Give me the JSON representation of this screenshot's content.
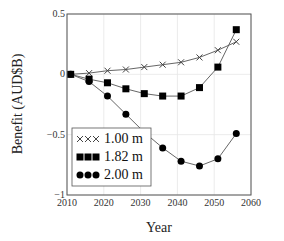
{
  "chart_data": {
    "type": "line",
    "title": "",
    "xlabel": "Year",
    "ylabel": "Benefit (AUD$B)",
    "xlim": [
      2010,
      2060
    ],
    "ylim": [
      -1,
      0.5
    ],
    "xticks": [
      2010,
      2020,
      2030,
      2040,
      2050,
      2060
    ],
    "xtick_labels": [
      "2010",
      "2020",
      "2030",
      "2040",
      "2050",
      "2060"
    ],
    "yticks": [
      -1,
      -0.5,
      0,
      0.5
    ],
    "ytick_labels": [
      "−1",
      "−0.5",
      "0",
      "0.5"
    ],
    "grid": true,
    "legend_position": "lower left",
    "x": [
      2011,
      2016,
      2021,
      2026,
      2031,
      2036,
      2041,
      2046,
      2051,
      2056
    ],
    "series": [
      {
        "name": "1.00 m",
        "marker": "x",
        "color": "#444444",
        "values": [
          0.0,
          0.01,
          0.03,
          0.04,
          0.06,
          0.08,
          0.1,
          0.14,
          0.2,
          0.27
        ]
      },
      {
        "name": "1.82 m",
        "marker": "square",
        "color": "#000000",
        "values": [
          0.0,
          -0.04,
          -0.07,
          -0.12,
          -0.16,
          -0.18,
          -0.18,
          -0.11,
          0.06,
          0.37
        ]
      },
      {
        "name": "2.00 m",
        "marker": "circle",
        "color": "#000000",
        "values": [
          0.0,
          -0.06,
          -0.18,
          -0.33,
          -0.48,
          -0.61,
          -0.72,
          -0.76,
          -0.7,
          -0.49
        ]
      }
    ]
  },
  "legend": {
    "items": [
      "1.00 m",
      "1.82 m",
      "2.00 m"
    ]
  },
  "axes": {
    "xlabel": "Year",
    "ylabel": "Benefit (AUD$B)"
  }
}
